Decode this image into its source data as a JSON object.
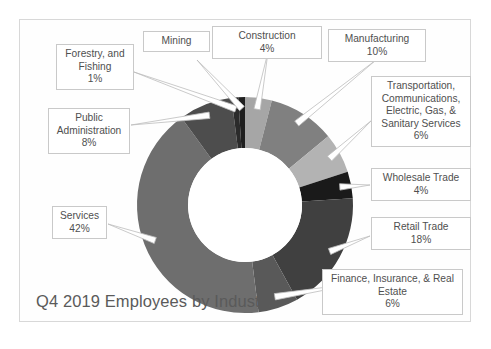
{
  "chart_data": {
    "type": "pie",
    "variant": "doughnut",
    "title": "Q4 2019 Employees by Industry",
    "xlabel": "",
    "ylabel": "",
    "legend_position": "callout-labels",
    "grid": false,
    "value_suffix": "%",
    "categories": [
      "Construction",
      "Manufacturing",
      "Transportation, Communications, Electric, Gas, & Sanitary Services",
      "Wholesale Trade",
      "Retail Trade",
      "Finance, Insurance, & Real Estate",
      "Services",
      "Public Administration",
      "Forestry, and Fishing",
      "Mining"
    ],
    "values": [
      4,
      10,
      6,
      4,
      18,
      6,
      42,
      8,
      1,
      1
    ],
    "slices": [
      {
        "label": "Construction",
        "value": 4,
        "pct_text": "4%",
        "color": "#a6a6a6"
      },
      {
        "label": "Manufacturing",
        "value": 10,
        "pct_text": "10%",
        "color": "#808080"
      },
      {
        "label": "Transportation, Communications, Electric, Gas, & Sanitary Services",
        "value": 6,
        "pct_text": "6%",
        "color": "#b3b3b3"
      },
      {
        "label": "Wholesale Trade",
        "value": 4,
        "pct_text": "4%",
        "color": "#1a1a1a"
      },
      {
        "label": "Retail Trade",
        "value": 18,
        "pct_text": "18%",
        "color": "#404040"
      },
      {
        "label": "Finance, Insurance, & Real Estate",
        "value": 6,
        "pct_text": "6%",
        "color": "#595959"
      },
      {
        "label": "Services",
        "value": 42,
        "pct_text": "42%",
        "color": "#6e6e6e"
      },
      {
        "label": "Public Administration",
        "value": 8,
        "pct_text": "8%",
        "color": "#4d4d4d"
      },
      {
        "label": "Forestry, and Fishing",
        "value": 1,
        "pct_text": "1%",
        "color": "#2b2b2b"
      },
      {
        "label": "Mining",
        "value": 1,
        "pct_text": "1%",
        "color": "#1f1f1f"
      }
    ]
  },
  "labels": {
    "forestry": {
      "text": "Forestry, and\nFishing\n1%"
    },
    "mining": {
      "text": "Mining"
    },
    "construction": {
      "text": "Construction\n4%"
    },
    "manufacturing": {
      "text": "Manufacturing\n10%"
    },
    "transportation": {
      "text": "Transportation,\nCommunications,\nElectric, Gas, &\nSanitary Services\n6%"
    },
    "wholesale": {
      "text": "Wholesale Trade\n4%"
    },
    "retail": {
      "text": "Retail Trade\n18%"
    },
    "finance": {
      "text": "Finance, Insurance, & Real\nEstate\n6%"
    },
    "services": {
      "text": "Services\n42%"
    },
    "public_admin": {
      "text": "Public\nAdministration\n8%"
    }
  },
  "title": "Q4 2019 Employees by Industry",
  "colors": {
    "frame_border": "#d8d8d8",
    "callout_border": "#c9c9c9",
    "leader_line": "#bdbdbd",
    "text": "#4f4f4f",
    "title_text": "#5a5a5a",
    "background": "#ffffff",
    "hole": "#ffffff"
  }
}
